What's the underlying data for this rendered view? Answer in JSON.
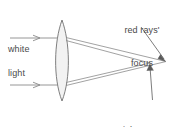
{
  "figure": {
    "width": 178,
    "height": 127,
    "background_color": "#ffffff"
  },
  "labels": {
    "incoming_top": "white",
    "incoming_bottom": "light",
    "red_focus_line1": "red rays'",
    "red_focus_line2": "focus",
    "violet_focus_line1": "violet rays'",
    "violet_focus_line2": "focus"
  },
  "colors": {
    "stroke": "#666666",
    "ray_stroke": "#8a8a8a",
    "lens_stroke": "#707070",
    "lens_fill": "#f2f2f2",
    "text": "#4a4a4a",
    "leader_stroke": "#5a5a5a"
  },
  "geometry": {
    "lens": {
      "center_x": 62,
      "top_y": 20,
      "bottom_y": 101,
      "half_thickness": 9
    },
    "incoming_rays": [
      {
        "name": "top-incoming-ray",
        "x1": 10,
        "y1": 38,
        "x2": 55,
        "y2": 38,
        "arrow_x": 38
      },
      {
        "name": "bottom-incoming-ray",
        "x1": 10,
        "y1": 85,
        "x2": 55,
        "y2": 85,
        "arrow_x": 38
      }
    ],
    "refracted_rays": [
      {
        "name": "upper-red-ray",
        "x1": 67,
        "y1": 38,
        "x2": 166,
        "y2": 62
      },
      {
        "name": "upper-violet-ray",
        "x1": 67,
        "y1": 41,
        "x2": 150,
        "y2": 63
      },
      {
        "name": "lower-red-ray",
        "x1": 67,
        "y1": 85,
        "x2": 166,
        "y2": 62
      },
      {
        "name": "lower-violet-ray",
        "x1": 67,
        "y1": 82,
        "x2": 150,
        "y2": 63
      }
    ],
    "focus_points": {
      "red": {
        "x": 166,
        "y": 62
      },
      "violet": {
        "x": 150,
        "y": 63
      }
    },
    "leader_lines": [
      {
        "name": "red-focus-leader",
        "x1": 142,
        "y1": 28,
        "x2": 164,
        "y2": 60
      },
      {
        "name": "violet-focus-leader",
        "x1": 152,
        "y1": 99,
        "x2": 150,
        "y2": 65
      }
    ]
  }
}
